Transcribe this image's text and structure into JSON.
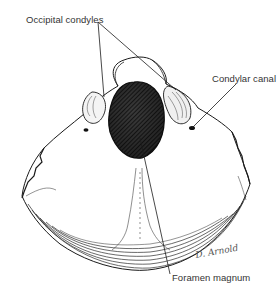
{
  "figure": {
    "labels": {
      "occipital_condyles": "Occipital condyles",
      "condylar_canal": "Condylar canal",
      "foramen_magnum": "Foramen magnum"
    },
    "signature": "D. Arnold",
    "colors": {
      "ink": "#1a1a1a",
      "label_text": "#333333",
      "foramen_fill": "#2a2a2a",
      "background": "#ffffff"
    }
  }
}
